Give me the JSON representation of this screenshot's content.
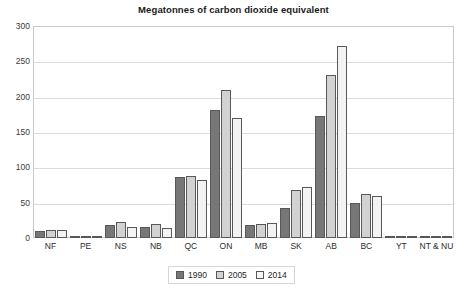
{
  "chart_data": {
    "type": "bar",
    "title": "Megatonnes of carbon dioxide equivalent",
    "xlabel": "",
    "ylabel": "",
    "ylim": [
      0,
      300
    ],
    "yticks": [
      0,
      50,
      100,
      150,
      200,
      250,
      300
    ],
    "grid": true,
    "legend_position": "bottom",
    "categories": [
      "NF",
      "PE",
      "NS",
      "NB",
      "QC",
      "ON",
      "MB",
      "SK",
      "AB",
      "BC",
      "YT",
      "NT & NU"
    ],
    "series": [
      {
        "name": "1990",
        "color": "#777777",
        "values": [
          10,
          2,
          19,
          16,
          86,
          181,
          18,
          43,
          172,
          50,
          1,
          2
        ]
      },
      {
        "name": "2005",
        "color": "#d2d2d2",
        "values": [
          11,
          2,
          23,
          20,
          88,
          209,
          20,
          68,
          231,
          62,
          1,
          2
        ]
      },
      {
        "name": "2014",
        "color": "#f3f3f3",
        "values": [
          11,
          2,
          16,
          14,
          82,
          170,
          21,
          72,
          272,
          60,
          1,
          2
        ]
      }
    ]
  },
  "legend": {
    "items": [
      {
        "label": "1990"
      },
      {
        "label": "2005"
      },
      {
        "label": "2014"
      }
    ]
  }
}
